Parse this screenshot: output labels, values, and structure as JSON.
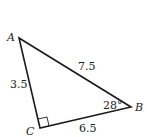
{
  "diagram": {
    "type": "right-triangle",
    "vertices": {
      "A": {
        "label": "A",
        "x": 19,
        "y": 38
      },
      "B": {
        "label": "B",
        "x": 131,
        "y": 107
      },
      "C": {
        "label": "C",
        "x": 40,
        "y": 128
      }
    },
    "sides": {
      "AB": "7.5",
      "AC": "3.5",
      "BC": "6.5"
    },
    "angle_B": "28°",
    "right_angle_at": "C",
    "stroke_color": "#1a1a1a"
  }
}
